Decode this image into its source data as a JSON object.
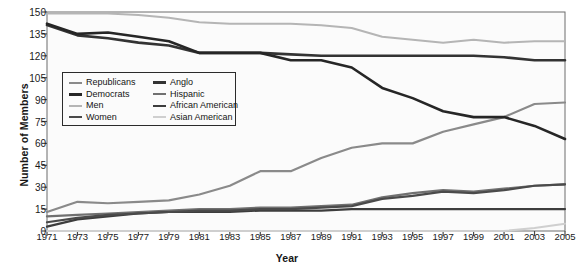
{
  "chart_data": {
    "type": "line",
    "title": "",
    "xlabel": "Year",
    "ylabel": "Number of Members",
    "xlim": [
      1971,
      2005
    ],
    "ylim": [
      0,
      150
    ],
    "ytick_step": 15,
    "grid": false,
    "legend_position": "upper-left-inside",
    "x": [
      1971,
      1973,
      1975,
      1977,
      1979,
      1981,
      1983,
      1985,
      1987,
      1989,
      1991,
      1993,
      1995,
      1997,
      1999,
      2001,
      2003,
      2005
    ],
    "xticklabels": [
      "1971",
      "1973",
      "1975",
      "1977",
      "1979",
      "1981",
      "1983",
      "1985",
      "1987",
      "1989",
      "1991",
      "1993",
      "1995",
      "1997",
      "1999",
      "2001",
      "2003",
      "2005"
    ],
    "yticklabels": [
      "0",
      "15",
      "30",
      "45",
      "60",
      "75",
      "90",
      "105",
      "120",
      "135",
      "150"
    ],
    "series": [
      {
        "name": "Republicans",
        "color": "#8a8a8a",
        "width": 2.2,
        "values": [
          13,
          20,
          19,
          20,
          21,
          25,
          31,
          41,
          41,
          50,
          57,
          60,
          60,
          68,
          73,
          78,
          87,
          88
        ]
      },
      {
        "name": "Democrats",
        "color": "#262626",
        "width": 2.6,
        "values": [
          142,
          135,
          136,
          133,
          130,
          122,
          122,
          122,
          117,
          117,
          112,
          98,
          91,
          82,
          78,
          78,
          72,
          63
        ]
      },
      {
        "name": "Men",
        "color": "#b5b5b5",
        "width": 2.0,
        "values": [
          149,
          149,
          149,
          148,
          146,
          143,
          142,
          142,
          142,
          141,
          139,
          133,
          131,
          129,
          131,
          129,
          130,
          130
        ]
      },
      {
        "name": "Women",
        "color": "#4a4a4a",
        "width": 2.2,
        "values": [
          6,
          9,
          11,
          12,
          13,
          14,
          14,
          15,
          15,
          16,
          17,
          22,
          24,
          27,
          26,
          28,
          31,
          32
        ]
      },
      {
        "name": "Anglo",
        "color": "#333333",
        "width": 2.6,
        "values": [
          141,
          134,
          132,
          129,
          127,
          122,
          122,
          122,
          121,
          120,
          120,
          120,
          120,
          120,
          120,
          119,
          117,
          117
        ]
      },
      {
        "name": "Hispanic",
        "color": "#707070",
        "width": 2.2,
        "values": [
          10,
          11,
          12,
          13,
          14,
          15,
          15,
          16,
          16,
          17,
          18,
          23,
          26,
          28,
          27,
          29,
          31,
          32
        ]
      },
      {
        "name": "African American",
        "color": "#3d3d3d",
        "width": 2.2,
        "values": [
          3,
          8,
          10,
          12,
          13,
          13,
          13,
          14,
          14,
          14,
          15,
          15,
          15,
          15,
          15,
          15,
          15,
          15
        ]
      },
      {
        "name": "Asian American",
        "color": "#cfcfcf",
        "width": 2.0,
        "values": [
          0,
          0,
          0,
          0,
          0,
          0,
          0,
          0,
          0,
          0,
          0,
          0,
          0,
          0,
          0,
          0,
          2,
          5
        ]
      }
    ]
  }
}
